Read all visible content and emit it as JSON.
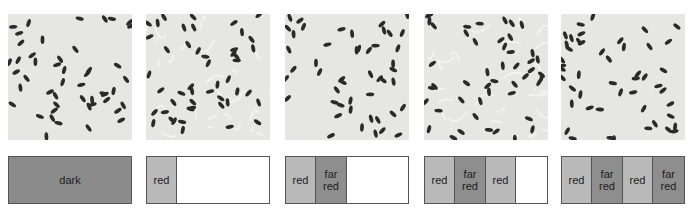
{
  "panels": [
    {
      "id": "p1",
      "left": 8,
      "germination": "low",
      "segments": [
        {
          "type": "dark",
          "label": "dark"
        }
      ]
    },
    {
      "id": "p2",
      "left": 146,
      "germination": "high",
      "segments": [
        {
          "type": "red",
          "label": "red"
        },
        {
          "type": "empty",
          "label": ""
        }
      ]
    },
    {
      "id": "p3",
      "left": 285,
      "germination": "low",
      "segments": [
        {
          "type": "red",
          "label": "red"
        },
        {
          "type": "far",
          "label": "far\nred"
        },
        {
          "type": "empty",
          "label": ""
        }
      ]
    },
    {
      "id": "p4",
      "left": 424,
      "germination": "high",
      "segments": [
        {
          "type": "red",
          "label": "red"
        },
        {
          "type": "far",
          "label": "far\nred"
        },
        {
          "type": "red",
          "label": "red"
        },
        {
          "type": "empty",
          "label": ""
        }
      ]
    },
    {
      "id": "p5",
      "left": 561,
      "germination": "low",
      "segments": [
        {
          "type": "red",
          "label": "red"
        },
        {
          "type": "far",
          "label": "far\nred"
        },
        {
          "type": "red",
          "label": "red"
        },
        {
          "type": "far",
          "label": "far\nred"
        }
      ]
    }
  ],
  "labels": {
    "p1": {
      "s0": "dark"
    },
    "p2": {
      "s0": "red"
    },
    "p3": {
      "s0": "red",
      "s1a": "far",
      "s1b": "red"
    },
    "p4": {
      "s0": "red",
      "s1a": "far",
      "s1b": "red",
      "s2": "red"
    },
    "p5": {
      "s0": "red",
      "s1a": "far",
      "s1b": "red",
      "s2": "red",
      "s3a": "far",
      "s3b": "red"
    }
  },
  "colors": {
    "photo_bg": "#e6e6e4",
    "seed": "#2a2a2a",
    "sprout": "#f4f4f2",
    "dark_segment": "#8b8b8b",
    "red_segment": "#b9b9b9",
    "far_red_segment": "#8e8e8e",
    "border": "#555555"
  }
}
